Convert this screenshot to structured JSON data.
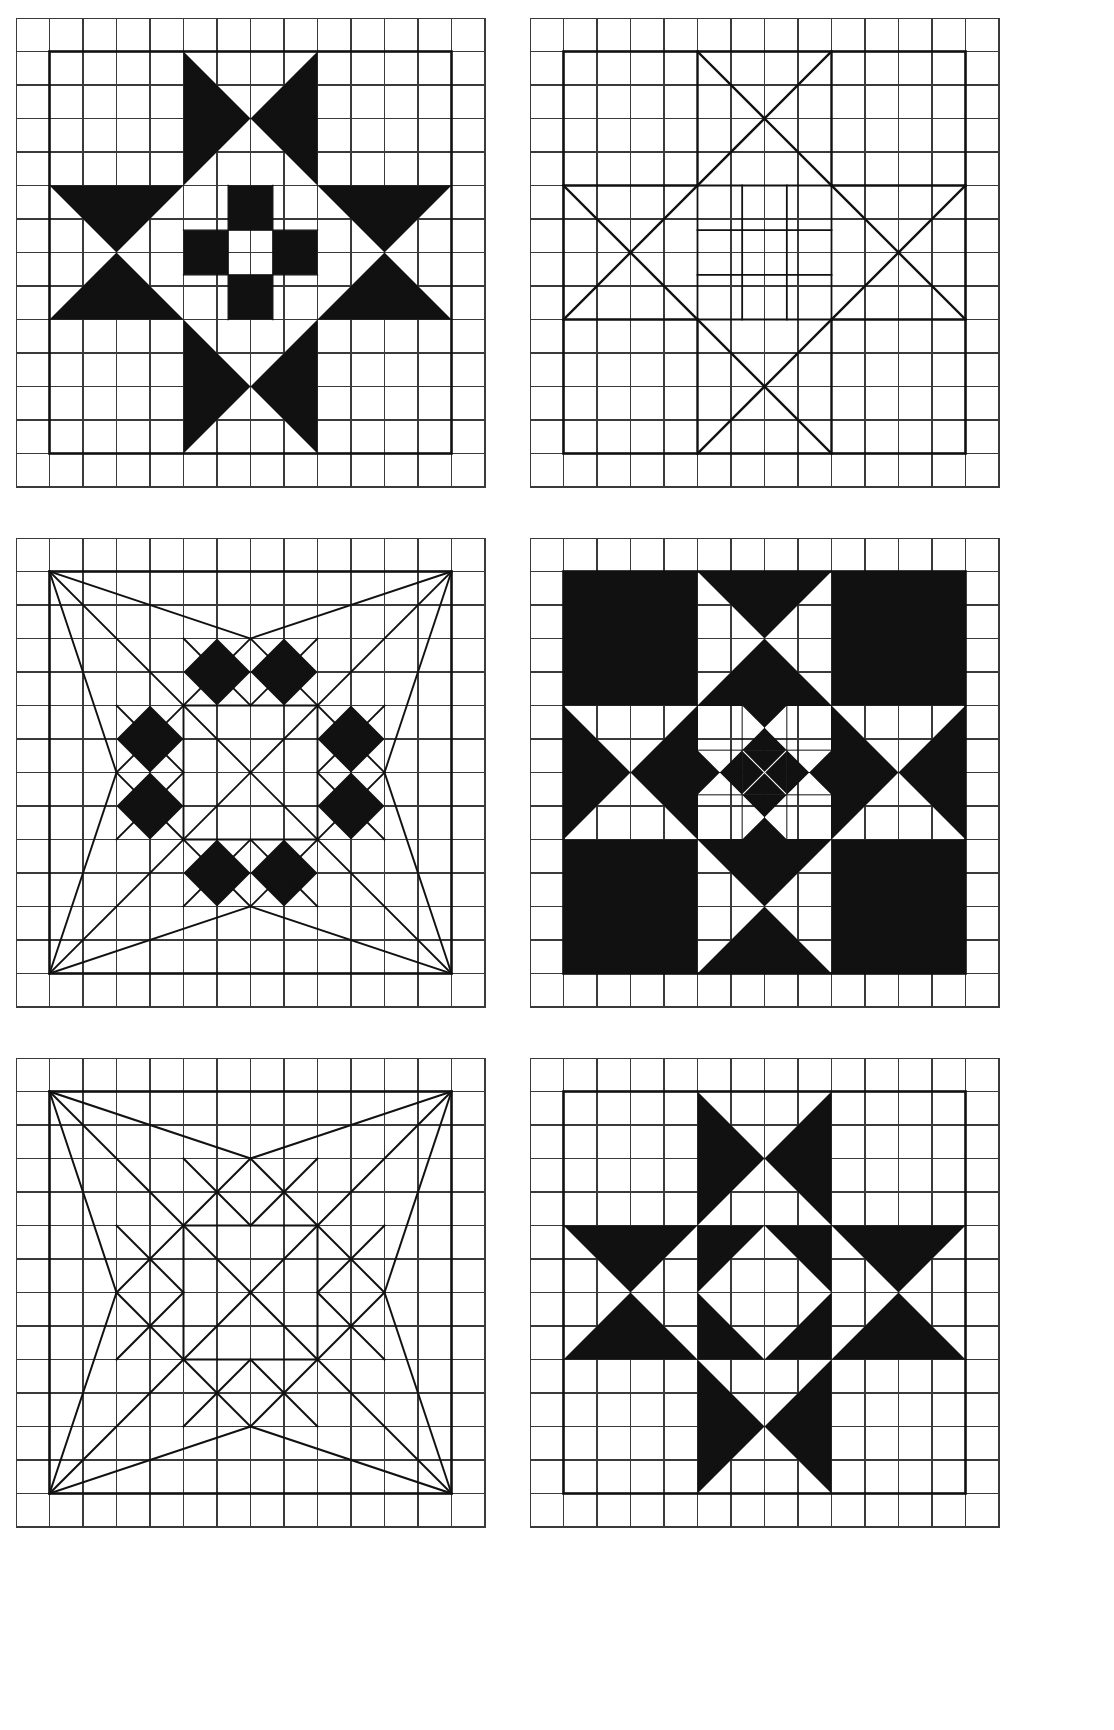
{
  "page": {
    "background_color": "#ffffff",
    "ink_color": "#111111",
    "grid_line_color": "#3a3a3a",
    "width": 1114,
    "height": 1730
  },
  "layout": {
    "columns": 2,
    "rows": 3,
    "panel_width": 470,
    "panel_height": 470,
    "grid_cells_across": 14,
    "grid_cells_down": 14,
    "cell_size": 33.5,
    "positions": [
      {
        "id": "panel-1",
        "x": 16,
        "y": 18
      },
      {
        "id": "panel-2",
        "x": 530,
        "y": 18
      },
      {
        "id": "panel-3",
        "x": 16,
        "y": 538
      },
      {
        "id": "panel-4",
        "x": 530,
        "y": 538
      },
      {
        "id": "panel-5",
        "x": 16,
        "y": 1058
      },
      {
        "id": "panel-6",
        "x": 530,
        "y": 1058
      }
    ]
  },
  "panels": [
    {
      "id": "panel-1",
      "name": "ohio-star-filled",
      "style": "filled",
      "block_units": 6,
      "block_origin_cell": [
        1,
        1
      ],
      "block_span_cells": 12,
      "description": "Ohio Star / Variable Star quilt block, solid black fill on graph paper. Four hourglass (quarter-square-triangle) points at the cardinal positions, with a nine-patch checkerboard center."
    },
    {
      "id": "panel-2",
      "name": "ohio-star-outline",
      "style": "outline",
      "block_units": 6,
      "block_origin_cell": [
        1,
        1
      ],
      "block_span_cells": 12,
      "description": "Line-drawing version of panel 1 showing only the pieced seam outlines of the Ohio Star block."
    },
    {
      "id": "panel-3",
      "name": "diamond-star-filled",
      "style": "filled",
      "block_units": 6,
      "block_origin_cell": [
        1,
        1
      ],
      "block_span_cells": 12,
      "description": "On-point diamond star block with solid black diamonds at the four edge midpoints and long corner-to-midpoint diagonals."
    },
    {
      "id": "panel-4",
      "name": "nested-star-filled",
      "style": "filled",
      "block_units": 6,
      "block_origin_cell": [
        1,
        1
      ],
      "block_span_cells": 12,
      "description": "Reverse-value Ohio Star with black corner squares and a recursively nested miniature Ohio Star occupying the center unit."
    },
    {
      "id": "panel-5",
      "name": "diamond-star-outline",
      "style": "outline",
      "block_units": 6,
      "block_origin_cell": [
        1,
        1
      ],
      "block_span_cells": 12,
      "description": "Line-drawing version of panel 3 showing only the seam outlines of the on-point diamond star block."
    },
    {
      "id": "panel-6",
      "name": "pinwheel-star-filled",
      "style": "filled",
      "block_units": 6,
      "block_origin_cell": [
        1,
        1
      ],
      "block_span_cells": 12,
      "description": "Ohio Star variation with solid black hourglass points at all four sides and an on-point black square set into the white center."
    }
  ]
}
